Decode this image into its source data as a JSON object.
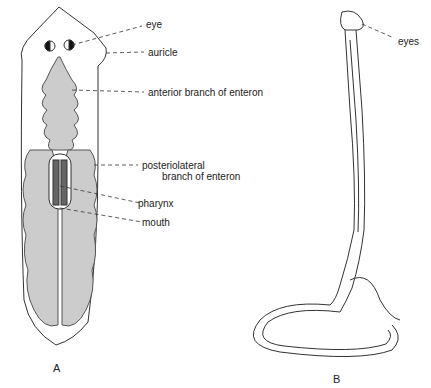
{
  "figure_a": {
    "caption": "A",
    "labels": {
      "eye": "eye",
      "auricle": "auricle",
      "anterior_branch": "anterior branch of enteron",
      "posteriolateral_1": "posteriolateral",
      "posteriolateral_2": "branch of enteron",
      "pharynx": "pharynx",
      "mouth": "mouth"
    }
  },
  "figure_b": {
    "caption": "B",
    "labels": {
      "eyes": "eyes"
    }
  }
}
